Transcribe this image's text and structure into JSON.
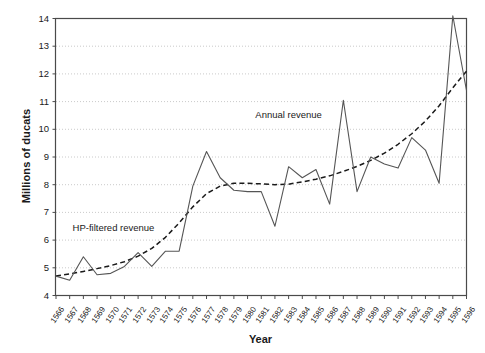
{
  "chart_data": {
    "type": "line",
    "title": "",
    "xlabel": "Year",
    "ylabel": "Millions of ducats",
    "xlim": [
      1566,
      1596
    ],
    "ylim": [
      4,
      14
    ],
    "yticks": [
      4,
      5,
      6,
      7,
      8,
      9,
      10,
      11,
      12,
      13,
      14
    ],
    "grid": "horizontal-dotted",
    "legend_position": "inline-annotations",
    "x": [
      1566,
      1567,
      1568,
      1569,
      1570,
      1571,
      1572,
      1573,
      1574,
      1575,
      1576,
      1577,
      1578,
      1579,
      1580,
      1581,
      1582,
      1583,
      1584,
      1585,
      1586,
      1587,
      1588,
      1589,
      1590,
      1591,
      1592,
      1593,
      1594,
      1595,
      1596
    ],
    "categories": [
      "1566",
      "1567",
      "1568",
      "1569",
      "1570",
      "1571",
      "1572",
      "1573",
      "1574",
      "1575",
      "1576",
      "1577",
      "1578",
      "1579",
      "1580",
      "1581",
      "1582",
      "1583",
      "1584",
      "1585",
      "1586",
      "1587",
      "1588",
      "1589",
      "1590",
      "1591",
      "1592",
      "1593",
      "1594",
      "1595",
      "1596"
    ],
    "series": [
      {
        "name": "Annual revenue",
        "style": "solid",
        "color": "#555555",
        "values": [
          4.7,
          4.55,
          5.4,
          4.75,
          4.8,
          5.05,
          5.55,
          5.05,
          5.6,
          5.6,
          7.95,
          9.2,
          8.25,
          7.8,
          7.75,
          7.75,
          6.5,
          8.65,
          8.25,
          8.55,
          7.3,
          11.05,
          7.75,
          9.0,
          8.75,
          8.6,
          9.7,
          9.25,
          8.05,
          14.1,
          11.4
        ]
      },
      {
        "name": "HP-filtered revenue",
        "style": "dashed",
        "color": "#1a1a1a",
        "values": [
          4.7,
          4.78,
          4.87,
          4.97,
          5.08,
          5.22,
          5.42,
          5.7,
          6.1,
          6.62,
          7.2,
          7.68,
          7.95,
          8.05,
          8.05,
          8.03,
          8.0,
          8.02,
          8.1,
          8.2,
          8.32,
          8.48,
          8.66,
          8.88,
          9.14,
          9.46,
          9.84,
          10.3,
          10.85,
          11.5,
          12.1
        ]
      }
    ],
    "annotations": [
      {
        "text": "Annual revenue",
        "x": 1583.0,
        "y": 10.5
      },
      {
        "text": "HP-filtered revenue",
        "x": 1570.2,
        "y": 6.45
      }
    ]
  }
}
